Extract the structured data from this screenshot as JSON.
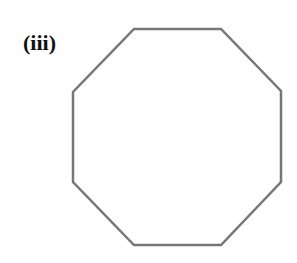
{
  "figure": {
    "label": "(iii)",
    "shape": "octagon",
    "stroke_color": "#777777",
    "vertices": [
      [
        134,
        29
      ],
      [
        221,
        29
      ],
      [
        281,
        91
      ],
      [
        281,
        182
      ],
      [
        221,
        245
      ],
      [
        134,
        245
      ],
      [
        73,
        182
      ],
      [
        73,
        92
      ]
    ]
  }
}
